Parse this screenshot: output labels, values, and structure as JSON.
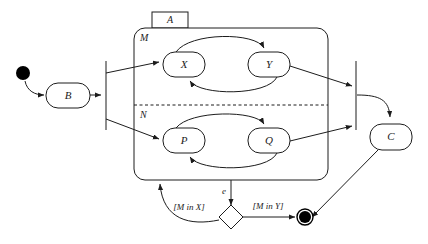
{
  "diagram": {
    "type": "uml-state-machine",
    "title": "A",
    "background_color": "#ffffff",
    "line_color": "#1c1c1c"
  },
  "composite_state": {
    "name": "A",
    "regions": [
      {
        "label": "M",
        "states": [
          "X",
          "Y"
        ]
      },
      {
        "label": "N",
        "states": [
          "P",
          "Q"
        ]
      }
    ]
  },
  "states": {
    "b": "B",
    "c": "C",
    "x": "X",
    "y": "Y",
    "p": "P",
    "q": "Q"
  },
  "pseudostates": {
    "initial": "initial-state",
    "fork": "fork-bar",
    "join": "join-bar",
    "choice": "choice-diamond",
    "final": "final-state"
  },
  "transitions": {
    "event_e": "e",
    "guard_m_in_x": "[M in X]",
    "guard_m_in_y": "[M in Y]"
  }
}
